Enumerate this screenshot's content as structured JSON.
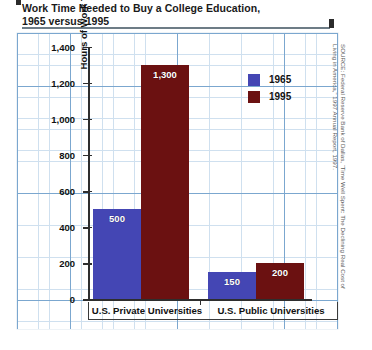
{
  "chart_data": {
    "type": "bar",
    "title": "Work Time Needed to Buy a College Education,\n1965 versus 1995",
    "xlabel": "",
    "ylabel": "Hours of Work Time Needed to Buy a College Education",
    "categories": [
      "U.S. Private Universities",
      "U.S. Public Universities"
    ],
    "series": [
      {
        "name": "1965",
        "color": "#4446b4",
        "values": [
          500,
          150
        ],
        "labels": [
          "500",
          "150"
        ]
      },
      {
        "name": "1995",
        "color": "#6b1111",
        "values": [
          1300,
          200
        ],
        "labels": [
          "1,300",
          "200"
        ]
      }
    ],
    "ylim": [
      0,
      1400
    ],
    "ytick_values": [
      1400,
      1200,
      1000,
      800,
      600,
      400,
      200,
      0
    ],
    "ytick_labels": [
      "1,400",
      "1,200",
      "1,000",
      "800",
      "600",
      "400",
      "200",
      "0"
    ],
    "grid": true,
    "legend_position": "upper-right",
    "source": "SOURCE: Federal Reserve Bank of Dallas, “Time Well Spent: The Declining Real Cost of\nLiving in America,” 1997 Annual Report, 1997."
  }
}
